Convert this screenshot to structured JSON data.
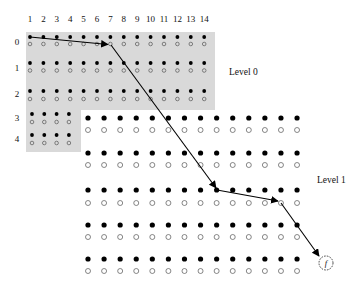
{
  "diagram": {
    "column_labels": [
      "1",
      "2",
      "3",
      "4",
      "5",
      "6",
      "7",
      "8",
      "9",
      "10",
      "11",
      "12",
      "13",
      "14"
    ],
    "row_labels": [
      "0",
      "1",
      "2",
      "3",
      "4"
    ],
    "level_labels": {
      "level0": "Level 0",
      "level1": "Level 1"
    },
    "end_node_label": "f",
    "level0": {
      "rows": [
        {
          "label": "0",
          "columns": 14
        },
        {
          "label": "1",
          "columns": 14
        },
        {
          "label": "2",
          "columns": 14
        },
        {
          "label": "3",
          "columns": 4
        },
        {
          "label": "4",
          "columns": 4
        }
      ],
      "node_pair": [
        "filled",
        "hollow"
      ]
    },
    "level1": {
      "rows": 5,
      "columns": 14,
      "node_pair": [
        "filled",
        "hollow"
      ]
    },
    "path": [
      {
        "from": "level0 row 0 col 1 filled",
        "to": "level0 row 0 col 7 hollow"
      },
      {
        "from": "level0 row 0 col 7 hollow",
        "to": "level1 row 3 col 9 filled"
      },
      {
        "from": "level1 row 3 col 9 filled",
        "to": "level1 row 3 col 13 hollow"
      },
      {
        "from": "level1 row 3 col 13 hollow",
        "to": "end node f"
      }
    ],
    "colors": {
      "shade": "#d9d9d9",
      "filled_node": "#000000",
      "hollow_node": "#555555",
      "arrow": "#000000",
      "text": "#111111"
    }
  }
}
